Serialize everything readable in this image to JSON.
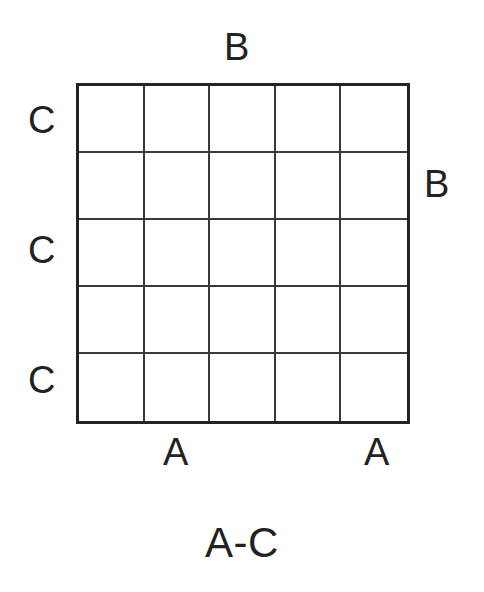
{
  "figure": {
    "type": "labelled-grid-diagram",
    "caption": "A-C",
    "background_color": "#ffffff",
    "line_color": "#3a3a3a",
    "border_color": "#232323",
    "text_color": "#222222"
  },
  "grid": {
    "rows": 5,
    "columns": 5,
    "cell_count": 25,
    "cells_empty": true
  },
  "labels": {
    "top": {
      "b": "B"
    },
    "right": {
      "b": "B"
    },
    "left": {
      "c1": "C",
      "c2": "C",
      "c3": "C"
    },
    "bottom": {
      "a1": "A",
      "a2": "A"
    }
  },
  "chart_data": {
    "type": "table",
    "title": "A-C",
    "xlabel": "A",
    "ylabel": "C",
    "grid": true,
    "rows": 5,
    "columns": 5,
    "annotations": [
      {
        "text": "B",
        "position": "top-center"
      },
      {
        "text": "B",
        "position": "right-middle"
      },
      {
        "text": "C",
        "position": "left-row-1"
      },
      {
        "text": "C",
        "position": "left-row-3"
      },
      {
        "text": "C",
        "position": "left-row-5"
      },
      {
        "text": "A",
        "position": "bottom-col-2"
      },
      {
        "text": "A",
        "position": "bottom-col-5"
      },
      {
        "text": "A-C",
        "position": "below-figure-center"
      }
    ],
    "values": [
      [
        "",
        "",
        "",
        "",
        ""
      ],
      [
        "",
        "",
        "",
        "",
        ""
      ],
      [
        "",
        "",
        "",
        "",
        ""
      ],
      [
        "",
        "",
        "",
        "",
        ""
      ],
      [
        "",
        "",
        "",
        "",
        ""
      ]
    ],
    "categories": [
      "1",
      "2",
      "3",
      "4",
      "5"
    ]
  }
}
